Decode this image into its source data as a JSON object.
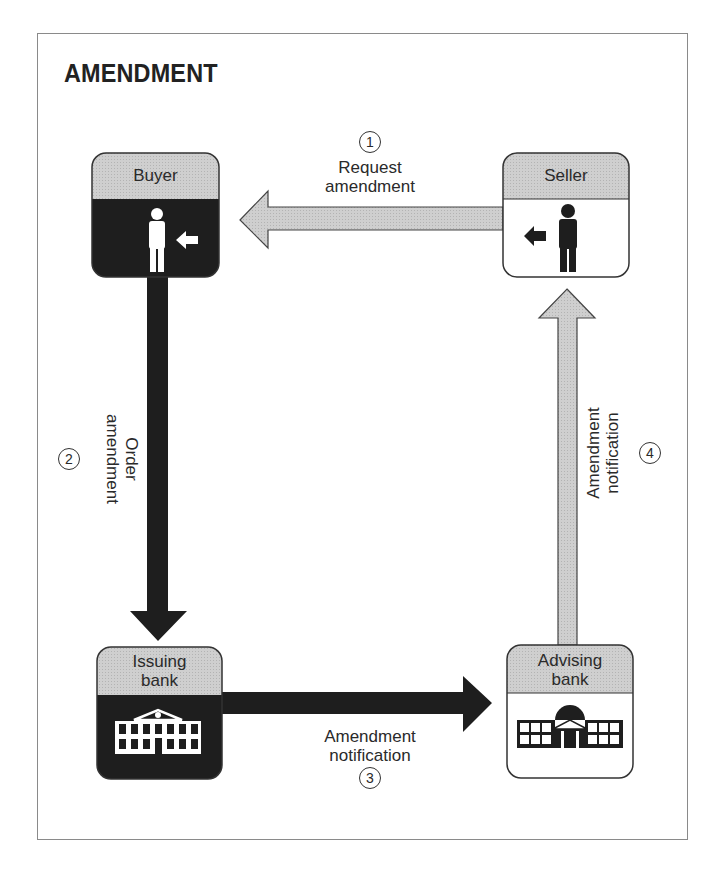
{
  "title": "AMENDMENT",
  "colors": {
    "dark": "#1e1e1e",
    "light_fill": "#c9c9c9",
    "outline": "#333333",
    "frame": "#8a8a8a"
  },
  "parties": {
    "buyer": {
      "label": "Buyer",
      "icon": "person-white-icon",
      "style": "dark"
    },
    "seller": {
      "label": "Seller",
      "icon": "person-black-icon",
      "style": "light"
    },
    "issuing_bank": {
      "label_line1": "Issuing",
      "label_line2": "bank",
      "icon": "bank-building-icon",
      "style": "dark"
    },
    "advising_bank": {
      "label_line1": "Advising",
      "label_line2": "bank",
      "icon": "domed-bank-icon",
      "style": "light"
    }
  },
  "steps": [
    {
      "number": "1",
      "line1": "Request",
      "line2": "amendment",
      "from": "Seller",
      "to": "Buyer",
      "arrow_style": "light"
    },
    {
      "number": "2",
      "line1": "Order",
      "line2": "amendment",
      "from": "Buyer",
      "to": "Issuing bank",
      "arrow_style": "dark"
    },
    {
      "number": "3",
      "line1": "Amendment",
      "line2": "notification",
      "from": "Issuing bank",
      "to": "Advising bank",
      "arrow_style": "dark"
    },
    {
      "number": "4",
      "line1": "Amendment",
      "line2": "notification",
      "from": "Advising bank",
      "to": "Seller",
      "arrow_style": "light"
    }
  ]
}
